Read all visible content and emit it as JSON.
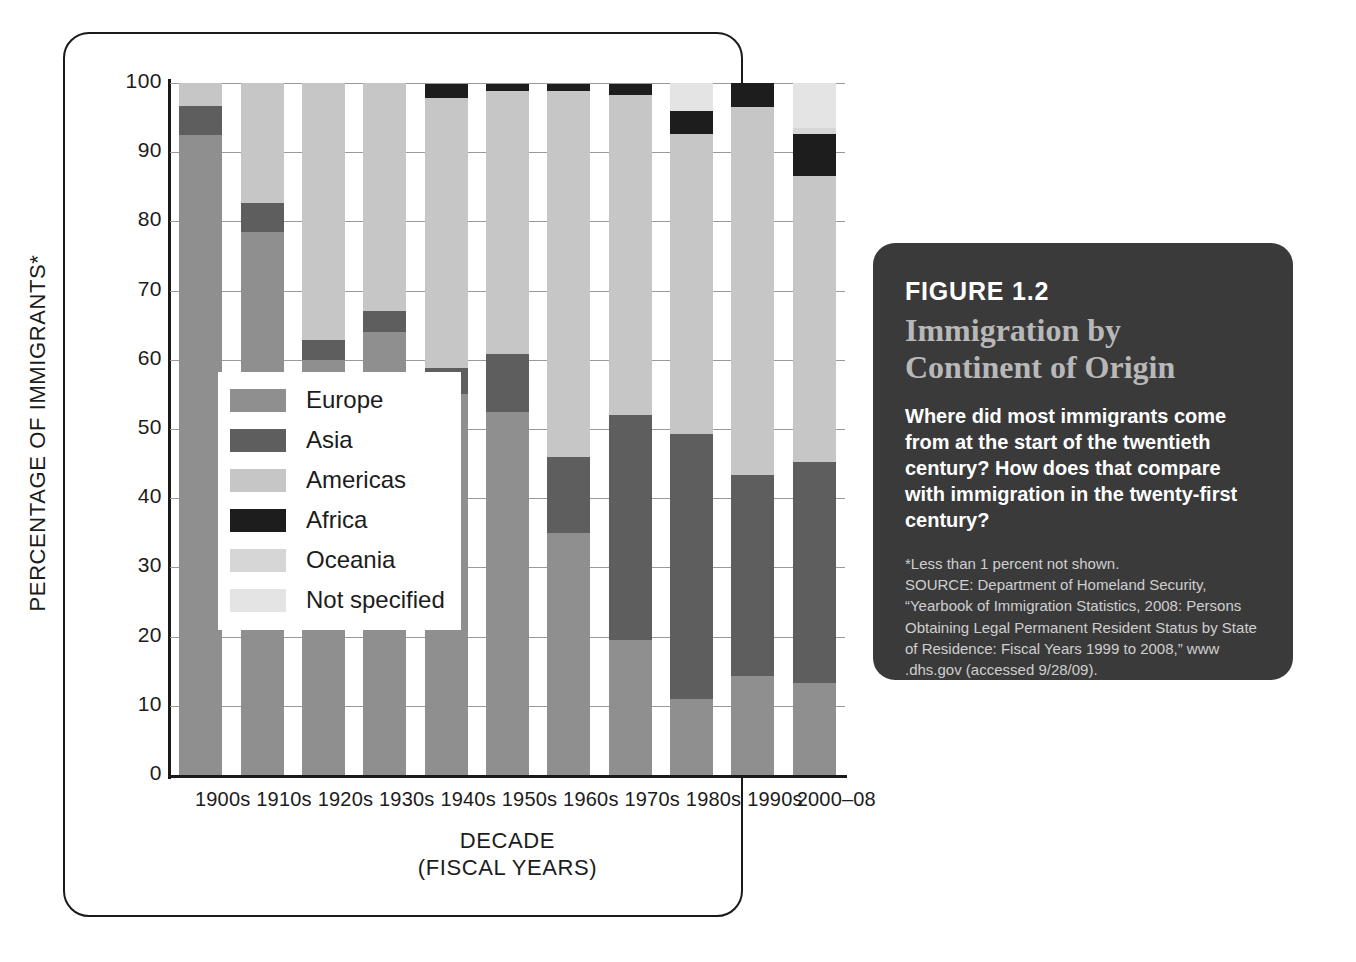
{
  "chart_data": {
    "type": "bar",
    "subtype": "stacked-percentage",
    "title": "Immigration by Continent of Origin",
    "xlabel": "DECADE (FISCAL YEARS)",
    "ylabel": "PERCENTAGE OF IMMIGRANTS*",
    "ylim": [
      0,
      100
    ],
    "yticks": [
      "0",
      "10",
      "20",
      "30",
      "40",
      "50",
      "60",
      "70",
      "80",
      "90",
      "100"
    ],
    "grid": true,
    "legend_position": "inside-lower-left",
    "categories": [
      "1900s",
      "1910s",
      "1920s",
      "1930s",
      "1940s",
      "1950s",
      "1960s",
      "1970s",
      "1980s",
      "1990s",
      "2000–08"
    ],
    "series": [
      {
        "name": "Europe",
        "color": "#8f8f8f",
        "values": [
          92.5,
          78.5,
          60.0,
          64.0,
          55.0,
          52.5,
          35.0,
          19.5,
          11.0,
          14.3,
          13.3
        ]
      },
      {
        "name": "Asia",
        "color": "#5e5e5e",
        "values": [
          4.2,
          4.2,
          2.9,
          3.0,
          3.8,
          8.3,
          11.0,
          32.5,
          38.3,
          29.0,
          32.0
        ]
      },
      {
        "name": "Americas",
        "color": "#c6c6c6",
        "values": [
          3.3,
          17.3,
          37.1,
          33.0,
          39.0,
          38.0,
          52.9,
          46.3,
          43.4,
          53.2,
          41.2
        ]
      },
      {
        "name": "Africa",
        "color": "#1d1d1d",
        "values": [
          0,
          0,
          0,
          0,
          2.0,
          1.0,
          1.0,
          1.5,
          3.3,
          3.5,
          6.2
        ]
      },
      {
        "name": "Oceania",
        "color": "#d6d6d6",
        "values": [
          0,
          0,
          0,
          0,
          0,
          0,
          0,
          0,
          0,
          0,
          0.8
        ]
      },
      {
        "name": "Not specified",
        "color": "#e4e4e4",
        "values": [
          0,
          0,
          0,
          0,
          0,
          0,
          0,
          0,
          4.0,
          0,
          6.5
        ]
      }
    ],
    "legend": [
      {
        "label": "Europe",
        "color": "#8f8f8f"
      },
      {
        "label": "Asia",
        "color": "#5e5e5e"
      },
      {
        "label": "Americas",
        "color": "#c6c6c6"
      },
      {
        "label": "Africa",
        "color": "#1d1d1d"
      },
      {
        "label": "Oceania",
        "color": "#d6d6d6"
      },
      {
        "label": "Not specified",
        "color": "#e4e4e4"
      }
    ]
  },
  "axes": {
    "y_title": "PERCENTAGE OF IMMIGRANTS*",
    "x_title_line1": "DECADE",
    "x_title_line2": "(FISCAL YEARS)"
  },
  "caption": {
    "figure_number": "FIGURE 1.2",
    "title_line1": "Immigration by",
    "title_line2": "Continent of Origin",
    "question": "Where did most immigrants come from at the start of the twentieth century? How does that compare with immigration in the twenty-first century?",
    "footnote": "*Less than 1 percent not shown.",
    "source": "SOURCE: Department of Homeland Security, “Yearbook of Immigration Statistics, 2008: Persons Obtaining Legal Permanent Resident Status by State of Residence: Fiscal Years 1999 to 2008,” www .dhs.gov (accessed 9/28/09)."
  },
  "colors": {
    "panel_background": "#3a3a3a",
    "panel_title": "#b8b8b8",
    "panel_text": "#ffffff",
    "frame_border": "#1a1a1a",
    "gridline": "#9a9a9a"
  }
}
